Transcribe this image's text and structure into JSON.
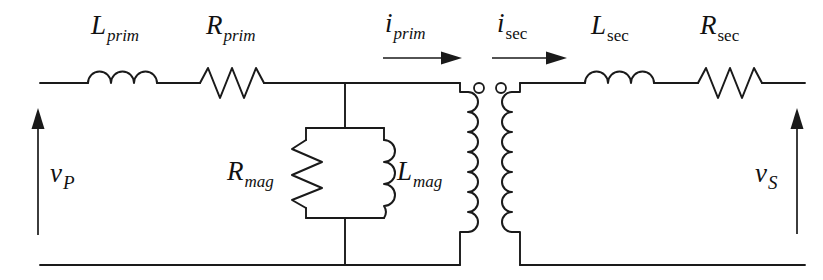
{
  "diagram": {
    "type": "transformer-equivalent-circuit",
    "background_color": "#ffffff",
    "line_color": "#1a1a1a"
  },
  "labels": {
    "l_prim": {
      "symbol": "L",
      "subscript": "prim",
      "subscript_style": "italic"
    },
    "r_prim": {
      "symbol": "R",
      "subscript": "prim",
      "subscript_style": "italic"
    },
    "i_prim": {
      "symbol": "i",
      "subscript": "prim",
      "subscript_style": "italic"
    },
    "i_sec": {
      "symbol": "i",
      "subscript": "sec",
      "subscript_style": "roman"
    },
    "l_sec": {
      "symbol": "L",
      "subscript": "sec",
      "subscript_style": "roman"
    },
    "r_sec": {
      "symbol": "R",
      "subscript": "sec",
      "subscript_style": "roman"
    },
    "r_mag": {
      "symbol": "R",
      "subscript": "mag",
      "subscript_style": "italic"
    },
    "l_mag": {
      "symbol": "L",
      "subscript": "mag",
      "subscript_style": "italic"
    },
    "v_p": {
      "symbol": "v",
      "subscript": "P",
      "subscript_style": "italic-capital"
    },
    "v_s": {
      "symbol": "v",
      "subscript": "S",
      "subscript_style": "italic-capital"
    }
  },
  "components": {
    "primary_series_inductor": "L_prim",
    "primary_series_resistor": "R_prim",
    "magnetizing_resistor": "R_mag",
    "magnetizing_inductor": "L_mag",
    "secondary_series_inductor": "L_sec",
    "secondary_series_resistor": "R_sec",
    "ideal_transformer": "coupled-windings-with-polarity-dots"
  },
  "currents": {
    "primary": "i_prim",
    "secondary": "i_sec"
  },
  "voltages": {
    "primary": "v_P",
    "secondary": "v_S"
  }
}
